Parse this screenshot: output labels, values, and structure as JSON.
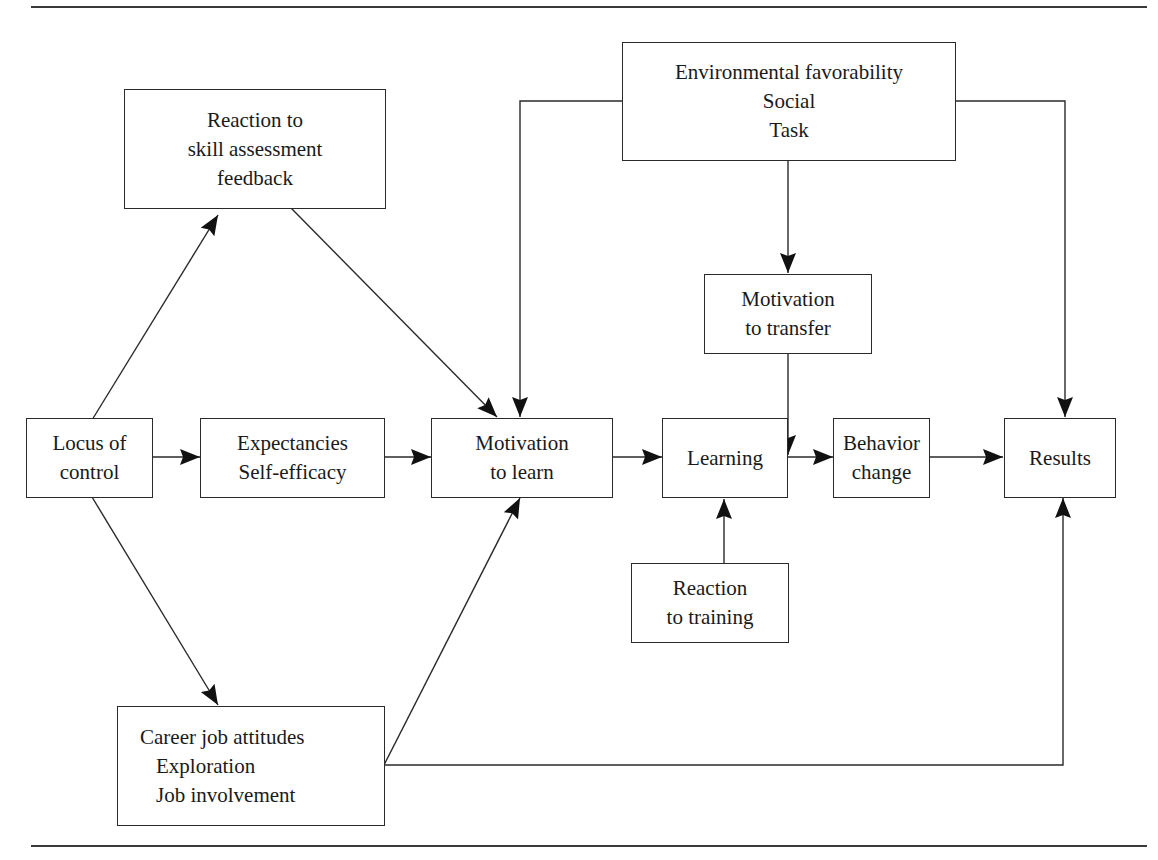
{
  "diagram": {
    "type": "flow-model",
    "nodes": {
      "reaction_skill": {
        "lines": [
          "Reaction to",
          "skill assessment",
          "feedback"
        ]
      },
      "environment": {
        "lines": [
          "Environmental favorability",
          "Social",
          "Task"
        ]
      },
      "motivation_transfer": {
        "lines": [
          "Motivation",
          "to transfer"
        ]
      },
      "locus": {
        "lines": [
          "Locus of",
          "control"
        ]
      },
      "expectancies": {
        "lines": [
          "Expectancies",
          "Self-efficacy"
        ]
      },
      "motivation_learn": {
        "lines": [
          "Motivation",
          "to learn"
        ]
      },
      "learning": {
        "lines": [
          "Learning"
        ]
      },
      "behavior": {
        "lines": [
          "Behavior",
          "change"
        ]
      },
      "results": {
        "lines": [
          "Results"
        ]
      },
      "reaction_training": {
        "lines": [
          "Reaction",
          "to training"
        ]
      },
      "career": {
        "lines": [
          "Career job attitudes",
          "Exploration",
          "Job involvement"
        ]
      }
    },
    "edges": [
      {
        "from": "Locus of control",
        "to": "Reaction to skill assessment feedback"
      },
      {
        "from": "Locus of control",
        "to": "Expectancies Self-efficacy"
      },
      {
        "from": "Locus of control",
        "to": "Career job attitudes"
      },
      {
        "from": "Reaction to skill assessment feedback",
        "to": "Motivation to learn"
      },
      {
        "from": "Expectancies Self-efficacy",
        "to": "Motivation to learn"
      },
      {
        "from": "Career job attitudes",
        "to": "Motivation to learn"
      },
      {
        "from": "Career job attitudes",
        "to": "Results"
      },
      {
        "from": "Environmental favorability",
        "to": "Motivation to learn"
      },
      {
        "from": "Environmental favorability",
        "to": "Motivation to transfer"
      },
      {
        "from": "Environmental favorability",
        "to": "Results"
      },
      {
        "from": "Motivation to learn",
        "to": "Learning"
      },
      {
        "from": "Reaction to training",
        "to": "Learning"
      },
      {
        "from": "Learning",
        "to": "Behavior change"
      },
      {
        "from": "Motivation to transfer",
        "to": "Learning-Behavior change link"
      },
      {
        "from": "Behavior change",
        "to": "Results"
      }
    ]
  }
}
